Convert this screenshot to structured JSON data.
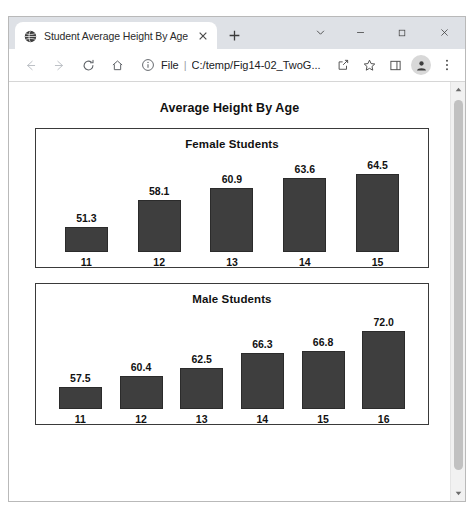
{
  "window": {
    "controls": {
      "tab_search": "tab-search-chevron",
      "minimize": "minimize",
      "maximize": "maximize",
      "close": "close"
    }
  },
  "tabs": [
    {
      "title": "Student Average Height By Age",
      "favicon": "globe-icon",
      "close_label": "×"
    }
  ],
  "new_tab_label": "+",
  "toolbar": {
    "back": "←",
    "forward": "→",
    "reload": "C",
    "home": "⌂",
    "info_icon": "info-circle-icon",
    "url_scheme": "File",
    "url_divider": "|",
    "url_text": "C:/temp/Fig14-02_TwoG...",
    "share_icon": "share-icon",
    "bookmark_icon": "star-icon",
    "side_panel_icon": "side-panel-icon",
    "profile_icon": "profile-avatar-icon",
    "menu_icon": "three-dot-menu-icon"
  },
  "page": {
    "title": "Average Height By Age"
  },
  "chart_data": [
    {
      "type": "bar",
      "title": "Female Students",
      "xlabel": "",
      "ylabel": "",
      "categories": [
        "11",
        "12",
        "13",
        "14",
        "15"
      ],
      "values": [
        51.3,
        58.1,
        60.9,
        63.6,
        64.5
      ],
      "value_labels": [
        "51.3",
        "58.1",
        "60.9",
        "63.6",
        "64.5"
      ],
      "bar_color": "#3e3e3e",
      "grid": false,
      "legend": "none",
      "baseline": 45.0,
      "ylim": [
        45.0,
        67.0
      ]
    },
    {
      "type": "bar",
      "title": "Male Students",
      "xlabel": "",
      "ylabel": "",
      "categories": [
        "11",
        "12",
        "13",
        "14",
        "15",
        "16"
      ],
      "values": [
        57.5,
        60.4,
        62.5,
        66.3,
        66.8,
        72.0
      ],
      "value_labels": [
        "57.5",
        "60.4",
        "62.5",
        "66.3",
        "66.8",
        "72.0"
      ],
      "bar_color": "#3e3e3e",
      "grid": false,
      "legend": "none",
      "baseline": 52.0,
      "ylim": [
        52.0,
        74.0
      ]
    }
  ]
}
